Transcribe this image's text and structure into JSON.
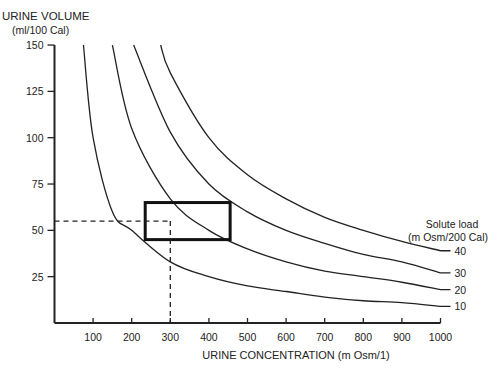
{
  "chart_data": {
    "type": "line",
    "title": "",
    "xlabel": "URINE CONCENTRATION (m Osm/1)",
    "ylabel": "URINE VOLUME",
    "ylabel_units": "(ml/100 Cal)",
    "xlim": [
      0,
      1000
    ],
    "ylim": [
      0,
      150
    ],
    "x_ticks": [
      100,
      200,
      300,
      400,
      500,
      600,
      700,
      800,
      900,
      1000
    ],
    "y_ticks": [
      25,
      50,
      75,
      100,
      125,
      150
    ],
    "grid": false,
    "legend_title": "Solute load",
    "legend_units": "(m Osm/200 Cal)",
    "series": [
      {
        "name": "10",
        "points": [
          [
            75,
            150
          ],
          [
            100,
            100
          ],
          [
            150,
            60
          ],
          [
            200,
            50
          ],
          [
            300,
            33
          ],
          [
            400,
            25
          ],
          [
            500,
            20
          ],
          [
            600,
            17
          ],
          [
            700,
            14
          ],
          [
            800,
            12
          ],
          [
            900,
            11
          ],
          [
            1000,
            9
          ]
        ]
      },
      {
        "name": "20",
        "points": [
          [
            150,
            150
          ],
          [
            200,
            105
          ],
          [
            300,
            67
          ],
          [
            400,
            50
          ],
          [
            500,
            40
          ],
          [
            600,
            33
          ],
          [
            700,
            28
          ],
          [
            800,
            25
          ],
          [
            900,
            22
          ],
          [
            1000,
            18
          ]
        ]
      },
      {
        "name": "30",
        "points": [
          [
            205,
            150
          ],
          [
            300,
            103
          ],
          [
            400,
            75
          ],
          [
            500,
            60
          ],
          [
            600,
            50
          ],
          [
            700,
            43
          ],
          [
            800,
            37
          ],
          [
            900,
            33
          ],
          [
            1000,
            27
          ]
        ]
      },
      {
        "name": "40",
        "points": [
          [
            275,
            150
          ],
          [
            300,
            135
          ],
          [
            400,
            100
          ],
          [
            500,
            80
          ],
          [
            600,
            67
          ],
          [
            700,
            57
          ],
          [
            800,
            50
          ],
          [
            900,
            44
          ],
          [
            1000,
            39
          ]
        ]
      }
    ],
    "annotations": {
      "box": {
        "x": [
          235,
          455
        ],
        "y": [
          45,
          65
        ]
      },
      "dashed_reference": {
        "x": 300,
        "y": 55
      }
    }
  }
}
